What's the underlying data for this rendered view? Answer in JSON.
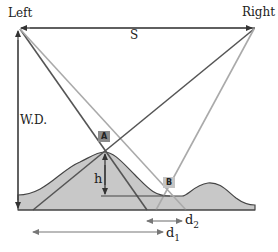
{
  "labels": {
    "left": "Left",
    "right": "Right",
    "baseline": "S",
    "working_distance": "W.D.",
    "height": "h",
    "d2_main": "d",
    "d2_sub": "2",
    "d1_main": "d",
    "d1_sub": "1",
    "point_a": "A",
    "point_b": "B"
  },
  "colors": {
    "dark_line": "#555555",
    "light_line": "#aaaaaa",
    "terrain_fill": "#c8c8c8",
    "terrain_outline": "#444444",
    "tag_a_bg": "#8a8a8a",
    "tag_b_bg": "#c4c4c4"
  }
}
